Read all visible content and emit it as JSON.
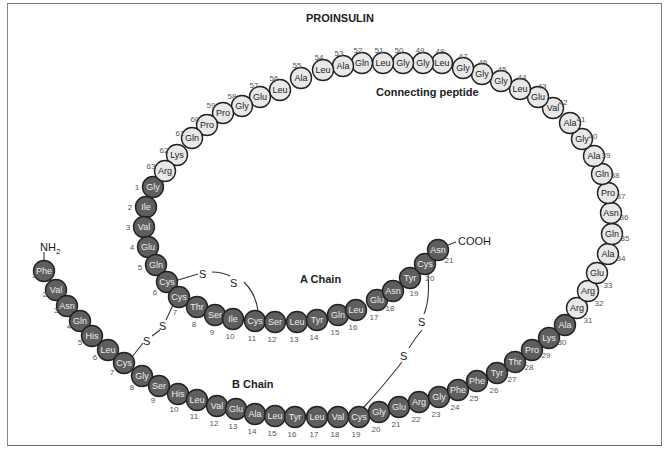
{
  "title": "PROINSULIN",
  "labels": {
    "connecting_peptide": "Connecting peptide",
    "a_chain": "A Chain",
    "b_chain": "B Chain",
    "n_terminus": "NH2",
    "c_terminus": "COOH",
    "sulfur": "S"
  },
  "colors": {
    "chain_residue_fill": "#5e5e5e",
    "peptide_residue_fill": "#e8e8e8",
    "outline": "#222222"
  },
  "b_chain": [
    {
      "n": 1,
      "aa": "Phe"
    },
    {
      "n": 2,
      "aa": "Val"
    },
    {
      "n": 3,
      "aa": "Asn"
    },
    {
      "n": 4,
      "aa": "Gln"
    },
    {
      "n": 5,
      "aa": "His"
    },
    {
      "n": 6,
      "aa": "Leu"
    },
    {
      "n": 7,
      "aa": "Cys"
    },
    {
      "n": 8,
      "aa": "Gly"
    },
    {
      "n": 9,
      "aa": "Ser"
    },
    {
      "n": 10,
      "aa": "His"
    },
    {
      "n": 11,
      "aa": "Leu"
    },
    {
      "n": 12,
      "aa": "Val"
    },
    {
      "n": 13,
      "aa": "Glu"
    },
    {
      "n": 14,
      "aa": "Ala"
    },
    {
      "n": 15,
      "aa": "Leu"
    },
    {
      "n": 16,
      "aa": "Tyr"
    },
    {
      "n": 17,
      "aa": "Leu"
    },
    {
      "n": 18,
      "aa": "Val"
    },
    {
      "n": 19,
      "aa": "Cys"
    },
    {
      "n": 20,
      "aa": "Gly"
    },
    {
      "n": 21,
      "aa": "Glu"
    },
    {
      "n": 22,
      "aa": "Arg"
    },
    {
      "n": 23,
      "aa": "Gly"
    },
    {
      "n": 24,
      "aa": "Phe"
    },
    {
      "n": 25,
      "aa": "Phe"
    },
    {
      "n": 26,
      "aa": "Tyr"
    },
    {
      "n": 27,
      "aa": "Thr"
    },
    {
      "n": 28,
      "aa": "Pro"
    },
    {
      "n": 29,
      "aa": "Lys"
    },
    {
      "n": 30,
      "aa": "Ala"
    }
  ],
  "connecting_peptide": [
    {
      "n": 31,
      "aa": "Arg"
    },
    {
      "n": 32,
      "aa": "Arg"
    },
    {
      "n": 33,
      "aa": "Glu"
    },
    {
      "n": 34,
      "aa": "Ala"
    },
    {
      "n": 35,
      "aa": "Gln"
    },
    {
      "n": 36,
      "aa": "Asn"
    },
    {
      "n": 37,
      "aa": "Pro"
    },
    {
      "n": 38,
      "aa": "Gln"
    },
    {
      "n": 39,
      "aa": "Ala"
    },
    {
      "n": 40,
      "aa": "Gly"
    },
    {
      "n": 41,
      "aa": "Ala"
    },
    {
      "n": 42,
      "aa": "Val"
    },
    {
      "n": 43,
      "aa": "Glu"
    },
    {
      "n": 44,
      "aa": "Leu"
    },
    {
      "n": 45,
      "aa": "Gly"
    },
    {
      "n": 46,
      "aa": "Gly"
    },
    {
      "n": 47,
      "aa": "Gly"
    },
    {
      "n": 48,
      "aa": "Leu"
    },
    {
      "n": 49,
      "aa": "Gly"
    },
    {
      "n": 50,
      "aa": "Gly"
    },
    {
      "n": 51,
      "aa": "Leu"
    },
    {
      "n": 52,
      "aa": "Gln"
    },
    {
      "n": 53,
      "aa": "Ala"
    },
    {
      "n": 54,
      "aa": "Leu"
    },
    {
      "n": 55,
      "aa": "Ala"
    },
    {
      "n": 56,
      "aa": "Leu"
    },
    {
      "n": 57,
      "aa": "Glu"
    },
    {
      "n": 58,
      "aa": "Gly"
    },
    {
      "n": 59,
      "aa": "Pro"
    },
    {
      "n": 60,
      "aa": "Pro"
    },
    {
      "n": 61,
      "aa": "Gln"
    },
    {
      "n": 62,
      "aa": "Lys"
    },
    {
      "n": 63,
      "aa": "Arg"
    }
  ],
  "a_chain": [
    {
      "n": 1,
      "aa": "Gly"
    },
    {
      "n": 2,
      "aa": "Ile"
    },
    {
      "n": 3,
      "aa": "Val"
    },
    {
      "n": 4,
      "aa": "Glu"
    },
    {
      "n": 5,
      "aa": "Gln"
    },
    {
      "n": 6,
      "aa": "Cys"
    },
    {
      "n": 7,
      "aa": "Cys"
    },
    {
      "n": 8,
      "aa": "Thr"
    },
    {
      "n": 9,
      "aa": "Ser"
    },
    {
      "n": 10,
      "aa": "Ile"
    },
    {
      "n": 11,
      "aa": "Cys"
    },
    {
      "n": 12,
      "aa": "Ser"
    },
    {
      "n": 13,
      "aa": "Leu"
    },
    {
      "n": 14,
      "aa": "Tyr"
    },
    {
      "n": 15,
      "aa": "Gln"
    },
    {
      "n": 16,
      "aa": "Leu"
    },
    {
      "n": 17,
      "aa": "Glu"
    },
    {
      "n": 18,
      "aa": "Asn"
    },
    {
      "n": 19,
      "aa": "Tyr"
    },
    {
      "n": 20,
      "aa": "Cys"
    },
    {
      "n": 21,
      "aa": "Asn"
    }
  ],
  "disulfide_bonds": [
    {
      "from": "A6",
      "to": "A11"
    },
    {
      "from": "A7",
      "to": "B7"
    },
    {
      "from": "A20",
      "to": "B19"
    }
  ]
}
